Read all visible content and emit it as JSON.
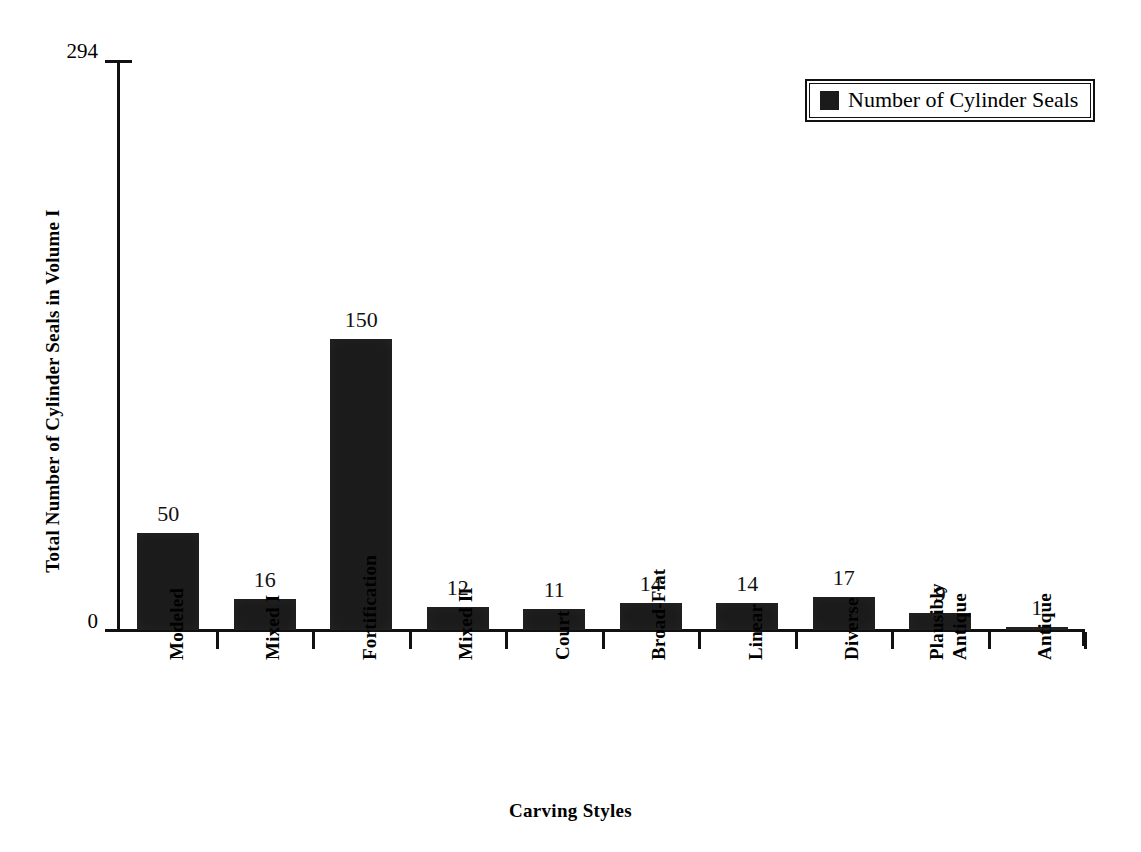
{
  "chart_data": {
    "type": "bar",
    "title": "",
    "xlabel": "Carving Styles",
    "ylabel": "Total Number of Cylinder Seals in Volume I",
    "categories": [
      "Modeled",
      "Mixed I",
      "Fortification",
      "Mixed II",
      "Court",
      "Broad-Flat",
      "Linear",
      "Diverse",
      "Plausibly Antique",
      "Antique"
    ],
    "category_lines": [
      [
        "Modeled"
      ],
      [
        "Mixed I"
      ],
      [
        "Fortification"
      ],
      [
        "Mixed II"
      ],
      [
        "Court"
      ],
      [
        "Broad-Flat"
      ],
      [
        "Linear"
      ],
      [
        "Diverse"
      ],
      [
        "Plausibly",
        "Antique"
      ],
      [
        "Antique"
      ]
    ],
    "values": [
      50,
      16,
      150,
      12,
      11,
      14,
      14,
      17,
      9,
      1
    ],
    "series": [
      {
        "name": "Number of Cylinder Seals",
        "values": [
          50,
          16,
          150,
          12,
          11,
          14,
          14,
          17,
          9,
          1
        ]
      }
    ],
    "ylim": [
      0,
      294
    ],
    "ytick_labels": [
      "294",
      "0"
    ],
    "ytick_values": [
      294,
      0
    ],
    "grid": false,
    "legend_position": "top-right",
    "bar_color": "#1b1b1b",
    "axis_color": "#111111",
    "data_labels_shown": true
  },
  "legend": {
    "entries": [
      {
        "label": "Number of Cylinder Seals",
        "color": "#1b1b1b"
      }
    ]
  },
  "axes": {
    "y_title": "Total Number of Cylinder Seals in Volume I",
    "x_title": "Carving Styles",
    "y_top_label": "294",
    "y_zero_label": "0"
  }
}
